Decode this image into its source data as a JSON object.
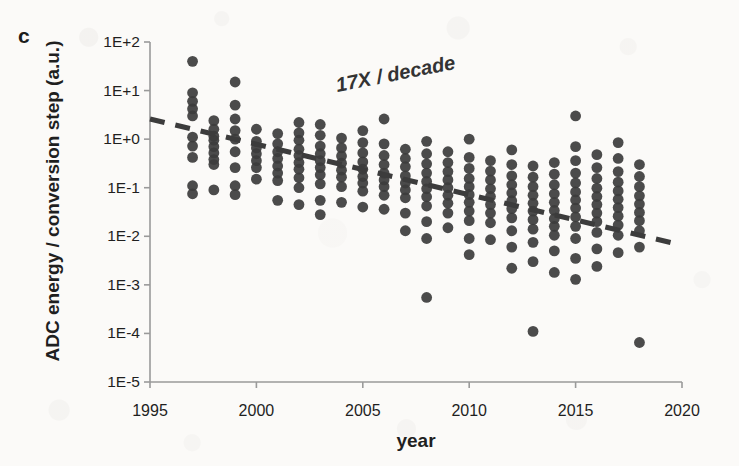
{
  "figure": {
    "panel_label": "c",
    "background_color": "#fbfaf8",
    "point_color": "#3c3c3c",
    "axis_color": "#9a9a9a",
    "text_color": "#1f1f1f"
  },
  "chart_data": {
    "type": "scatter",
    "title": "",
    "xlabel": "year",
    "ylabel": "ADC energy / conversion step (a.u.)",
    "xlim": [
      1995,
      2020
    ],
    "ylim": [
      1e-05,
      100
    ],
    "yscale": "log",
    "xscale": "linear",
    "grid": false,
    "legend": null,
    "xticks": [
      1995,
      2000,
      2005,
      2010,
      2015,
      2020
    ],
    "xticklabels": [
      "1995",
      "2000",
      "2005",
      "2010",
      "2015",
      "2020"
    ],
    "yticks": [
      100,
      10,
      1,
      0.1,
      0.01,
      0.001,
      0.0001,
      1e-05
    ],
    "yticklabels": [
      "1E+2",
      "1E+1",
      "1E+0",
      "1E-1",
      "1E-2",
      "1E-3",
      "1E-4",
      "1E-5"
    ],
    "annotations": [
      {
        "text": "17X / decade",
        "x": 2006.2,
        "y": 5.5,
        "rotation": -11,
        "style": "bold-italic"
      }
    ],
    "trendline": {
      "label": "17X / decade",
      "style": "dashed",
      "color": "#3c3c3c",
      "x_start": 1995.0,
      "y_start": 2.6,
      "x_end": 2019.6,
      "y_end": 0.0072,
      "decades_per_decade": -1.23,
      "factor_per_decade": 17
    },
    "series": [
      {
        "name": "ADC designs",
        "marker": "circle",
        "color": "#3c3c3c",
        "points": [
          [
            1997.0,
            40
          ],
          [
            1997.0,
            9.0
          ],
          [
            1997.0,
            6.0
          ],
          [
            1997.0,
            4.2
          ],
          [
            1997.0,
            3.0
          ],
          [
            1997.0,
            1.1
          ],
          [
            1997.0,
            0.72
          ],
          [
            1997.0,
            0.42
          ],
          [
            1997.0,
            0.11
          ],
          [
            1997.0,
            0.075
          ],
          [
            1998.0,
            2.4
          ],
          [
            1998.0,
            1.6
          ],
          [
            1998.0,
            1.15
          ],
          [
            1998.0,
            0.95
          ],
          [
            1998.0,
            0.7
          ],
          [
            1998.0,
            0.52
          ],
          [
            1998.0,
            0.38
          ],
          [
            1998.0,
            0.3
          ],
          [
            1998.0,
            0.09
          ],
          [
            1999.0,
            15
          ],
          [
            1999.0,
            5.0
          ],
          [
            1999.0,
            2.6
          ],
          [
            1999.0,
            1.5
          ],
          [
            1999.0,
            1.0
          ],
          [
            1999.0,
            0.55
          ],
          [
            1999.0,
            0.26
          ],
          [
            1999.0,
            0.11
          ],
          [
            1999.0,
            0.072
          ],
          [
            2000.0,
            1.6
          ],
          [
            2000.0,
            0.9
          ],
          [
            2000.0,
            0.66
          ],
          [
            2000.0,
            0.5
          ],
          [
            2000.0,
            0.36
          ],
          [
            2000.0,
            0.26
          ],
          [
            2000.0,
            0.15
          ],
          [
            2001.0,
            1.3
          ],
          [
            2001.0,
            0.8
          ],
          [
            2001.0,
            0.55
          ],
          [
            2001.0,
            0.4
          ],
          [
            2001.0,
            0.28
          ],
          [
            2001.0,
            0.2
          ],
          [
            2001.0,
            0.14
          ],
          [
            2001.0,
            0.055
          ],
          [
            2002.0,
            2.2
          ],
          [
            2002.0,
            1.35
          ],
          [
            2002.0,
            0.95
          ],
          [
            2002.0,
            0.62
          ],
          [
            2002.0,
            0.46
          ],
          [
            2002.0,
            0.33
          ],
          [
            2002.0,
            0.24
          ],
          [
            2002.0,
            0.16
          ],
          [
            2002.0,
            0.1
          ],
          [
            2002.0,
            0.045
          ],
          [
            2003.0,
            2.0
          ],
          [
            2003.0,
            1.2
          ],
          [
            2003.0,
            0.72
          ],
          [
            2003.0,
            0.5
          ],
          [
            2003.0,
            0.36
          ],
          [
            2003.0,
            0.26
          ],
          [
            2003.0,
            0.185
          ],
          [
            2003.0,
            0.12
          ],
          [
            2003.0,
            0.055
          ],
          [
            2003.0,
            0.028
          ],
          [
            2004.0,
            1.05
          ],
          [
            2004.0,
            0.66
          ],
          [
            2004.0,
            0.45
          ],
          [
            2004.0,
            0.32
          ],
          [
            2004.0,
            0.23
          ],
          [
            2004.0,
            0.165
          ],
          [
            2004.0,
            0.105
          ],
          [
            2004.0,
            0.05
          ],
          [
            2005.0,
            1.5
          ],
          [
            2005.0,
            0.85
          ],
          [
            2005.0,
            0.52
          ],
          [
            2005.0,
            0.34
          ],
          [
            2005.0,
            0.24
          ],
          [
            2005.0,
            0.17
          ],
          [
            2005.0,
            0.125
          ],
          [
            2005.0,
            0.085
          ],
          [
            2005.0,
            0.04
          ],
          [
            2006.0,
            2.6
          ],
          [
            2006.0,
            0.8
          ],
          [
            2006.0,
            0.46
          ],
          [
            2006.0,
            0.3
          ],
          [
            2006.0,
            0.2
          ],
          [
            2006.0,
            0.145
          ],
          [
            2006.0,
            0.105
          ],
          [
            2006.0,
            0.07
          ],
          [
            2006.0,
            0.036
          ],
          [
            2007.0,
            0.62
          ],
          [
            2007.0,
            0.4
          ],
          [
            2007.0,
            0.27
          ],
          [
            2007.0,
            0.175
          ],
          [
            2007.0,
            0.125
          ],
          [
            2007.0,
            0.09
          ],
          [
            2007.0,
            0.062
          ],
          [
            2007.0,
            0.03
          ],
          [
            2007.0,
            0.013
          ],
          [
            2008.0,
            0.9
          ],
          [
            2008.0,
            0.5
          ],
          [
            2008.0,
            0.31
          ],
          [
            2008.0,
            0.2
          ],
          [
            2008.0,
            0.135
          ],
          [
            2008.0,
            0.095
          ],
          [
            2008.0,
            0.065
          ],
          [
            2008.0,
            0.042
          ],
          [
            2008.0,
            0.02
          ],
          [
            2008.0,
            0.009
          ],
          [
            2008.0,
            0.00055
          ],
          [
            2009.0,
            0.55
          ],
          [
            2009.0,
            0.33
          ],
          [
            2009.0,
            0.215
          ],
          [
            2009.0,
            0.145
          ],
          [
            2009.0,
            0.1
          ],
          [
            2009.0,
            0.07
          ],
          [
            2009.0,
            0.048
          ],
          [
            2009.0,
            0.03
          ],
          [
            2009.0,
            0.015
          ],
          [
            2010.0,
            1.0
          ],
          [
            2010.0,
            0.42
          ],
          [
            2010.0,
            0.25
          ],
          [
            2010.0,
            0.155
          ],
          [
            2010.0,
            0.105
          ],
          [
            2010.0,
            0.072
          ],
          [
            2010.0,
            0.05
          ],
          [
            2010.0,
            0.033
          ],
          [
            2010.0,
            0.021
          ],
          [
            2010.0,
            0.009
          ],
          [
            2010.0,
            0.0042
          ],
          [
            2011.0,
            0.36
          ],
          [
            2011.0,
            0.22
          ],
          [
            2011.0,
            0.145
          ],
          [
            2011.0,
            0.095
          ],
          [
            2011.0,
            0.066
          ],
          [
            2011.0,
            0.045
          ],
          [
            2011.0,
            0.03
          ],
          [
            2011.0,
            0.019
          ],
          [
            2011.0,
            0.0085
          ],
          [
            2012.0,
            0.6
          ],
          [
            2012.0,
            0.3
          ],
          [
            2012.0,
            0.175
          ],
          [
            2012.0,
            0.115
          ],
          [
            2012.0,
            0.078
          ],
          [
            2012.0,
            0.054
          ],
          [
            2012.0,
            0.037
          ],
          [
            2012.0,
            0.024
          ],
          [
            2012.0,
            0.013
          ],
          [
            2012.0,
            0.006
          ],
          [
            2012.0,
            0.0022
          ],
          [
            2013.0,
            0.28
          ],
          [
            2013.0,
            0.165
          ],
          [
            2013.0,
            0.105
          ],
          [
            2013.0,
            0.07
          ],
          [
            2013.0,
            0.048
          ],
          [
            2013.0,
            0.033
          ],
          [
            2013.0,
            0.022
          ],
          [
            2013.0,
            0.014
          ],
          [
            2013.0,
            0.0075
          ],
          [
            2013.0,
            0.003
          ],
          [
            2013.0,
            0.00011
          ],
          [
            2014.0,
            0.33
          ],
          [
            2014.0,
            0.19
          ],
          [
            2014.0,
            0.115
          ],
          [
            2014.0,
            0.075
          ],
          [
            2014.0,
            0.05
          ],
          [
            2014.0,
            0.034
          ],
          [
            2014.0,
            0.023
          ],
          [
            2014.0,
            0.016
          ],
          [
            2014.0,
            0.0105
          ],
          [
            2014.0,
            0.005
          ],
          [
            2014.0,
            0.0018
          ],
          [
            2015.0,
            3.0
          ],
          [
            2015.0,
            0.7
          ],
          [
            2015.0,
            0.36
          ],
          [
            2015.0,
            0.2
          ],
          [
            2015.0,
            0.125
          ],
          [
            2015.0,
            0.082
          ],
          [
            2015.0,
            0.056
          ],
          [
            2015.0,
            0.038
          ],
          [
            2015.0,
            0.025
          ],
          [
            2015.0,
            0.016
          ],
          [
            2015.0,
            0.009
          ],
          [
            2015.0,
            0.0035
          ],
          [
            2015.0,
            0.0013
          ],
          [
            2016.0,
            0.48
          ],
          [
            2016.0,
            0.26
          ],
          [
            2016.0,
            0.155
          ],
          [
            2016.0,
            0.098
          ],
          [
            2016.0,
            0.066
          ],
          [
            2016.0,
            0.045
          ],
          [
            2016.0,
            0.03
          ],
          [
            2016.0,
            0.02
          ],
          [
            2016.0,
            0.012
          ],
          [
            2016.0,
            0.0055
          ],
          [
            2016.0,
            0.0024
          ],
          [
            2017.0,
            0.85
          ],
          [
            2017.0,
            0.4
          ],
          [
            2017.0,
            0.215
          ],
          [
            2017.0,
            0.13
          ],
          [
            2017.0,
            0.086
          ],
          [
            2017.0,
            0.058
          ],
          [
            2017.0,
            0.039
          ],
          [
            2017.0,
            0.026
          ],
          [
            2017.0,
            0.017
          ],
          [
            2017.0,
            0.0105
          ],
          [
            2017.0,
            0.0046
          ],
          [
            2018.0,
            0.3
          ],
          [
            2018.0,
            0.17
          ],
          [
            2018.0,
            0.105
          ],
          [
            2018.0,
            0.068
          ],
          [
            2018.0,
            0.046
          ],
          [
            2018.0,
            0.031
          ],
          [
            2018.0,
            0.021
          ],
          [
            2018.0,
            0.013
          ],
          [
            2018.0,
            0.006
          ],
          [
            2018.0,
            6.5e-05
          ]
        ]
      }
    ]
  }
}
